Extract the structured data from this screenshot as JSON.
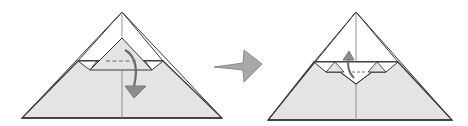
{
  "diagram": {
    "type": "origami-step",
    "steps": [
      {
        "id": "step-before",
        "description": "Fold the top flap down along the dashed valley line",
        "fold_type": "valley-fold",
        "arrow_direction": "down"
      },
      {
        "id": "step-after",
        "description": "Result with small triangle pleats; fold flap back up",
        "arrow_direction": "up"
      }
    ],
    "transition_arrow": "right",
    "colors": {
      "paper_colored": "#e4e4e4",
      "paper_white": "#ffffff",
      "outline": "#3a3a3a",
      "crease": "#7a7a7a",
      "arrow_fill": "#8c8c8c",
      "arrow_stroke": "#6a6a6a"
    }
  }
}
